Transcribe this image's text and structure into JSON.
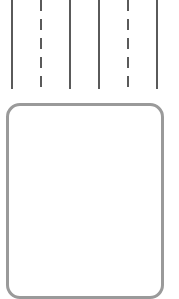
{
  "lanes": [
    {
      "x": 12,
      "style": "solid"
    },
    {
      "x": 41,
      "style": "dashed"
    },
    {
      "x": 70,
      "style": "solid"
    },
    {
      "x": 99,
      "style": "solid"
    },
    {
      "x": 128,
      "style": "dashed"
    },
    {
      "x": 157,
      "style": "solid"
    }
  ],
  "colors": {
    "line": "#5a5a5a",
    "box_border": "#9a9a9a",
    "background": "#ffffff"
  }
}
